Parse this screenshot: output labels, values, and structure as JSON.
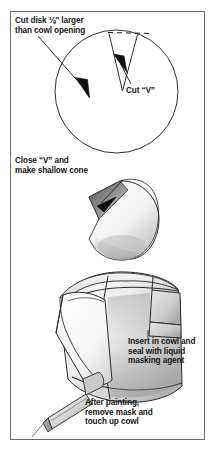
{
  "figure": {
    "kind": "technical-illustration",
    "border_color": "#6d6d6d",
    "background_color": "#ffffff",
    "ink_color": "#151515"
  },
  "captions": {
    "cut_disk": "Cut disk ⅛\" larger\nthan cowl opening",
    "cut_v": "Cut “V”",
    "close_v": "Close “V” and\nmake shallow cone",
    "insert_in_cowl": "Insert in cowl and\nseal with liquid\nmasking agent",
    "after_painting": "After painting,\nremove mask and\ntouch up cowl"
  },
  "steps": [
    {
      "index": 1,
      "label": "Cut disk ⅛\" larger than cowl opening",
      "detail": "Cut “V”"
    },
    {
      "index": 2,
      "label": "Close “V” and make shallow cone"
    },
    {
      "index": 3,
      "label": "Insert in cowl and seal with liquid masking agent",
      "detail": "After painting, remove mask and touch up cowl"
    }
  ]
}
